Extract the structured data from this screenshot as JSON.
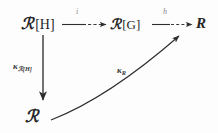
{
  "figure": {
    "kind": "commutative-diagram",
    "background_color": "#fdfdfd",
    "ink_color": "#262626",
    "width": 218,
    "height": 133
  },
  "nodes": {
    "top_left": {
      "name": "R[H]",
      "script_letter": "ℛ",
      "bracket": "[H]",
      "x": 21,
      "y": 16
    },
    "top_middle": {
      "name": "A[G]",
      "script_letter": "ℛ",
      "bracket": "[G]",
      "x": 110,
      "y": 17
    },
    "top_right": {
      "name": "R",
      "letter": "R",
      "x": 196,
      "y": 16
    },
    "bottom_left": {
      "name": "R",
      "script_letter": "ℛ",
      "x": 25,
      "y": 108
    }
  },
  "arrows": {
    "top_first": {
      "from": "R[H]",
      "to": "A[G]",
      "label": "i",
      "style": "horizontal-solid-with-dashes",
      "label_x": 76,
      "label_y": 8
    },
    "top_second": {
      "from": "A[G]",
      "to": "R",
      "label": "h",
      "style": "horizontal-solid-with-dashes",
      "label_x": 163,
      "label_y": 8
    },
    "vertical": {
      "from": "R[H]",
      "to": "R",
      "label_symbol": "κ",
      "label_subscript": "ℛ[H]",
      "style": "vertical-solid",
      "label_x": 13,
      "label_y": 62
    },
    "diagonal": {
      "from": "R",
      "to": "R",
      "label_symbol": "κ",
      "label_subscript": "R",
      "style": "curved-solid",
      "label_x": 117,
      "label_y": 66
    }
  }
}
